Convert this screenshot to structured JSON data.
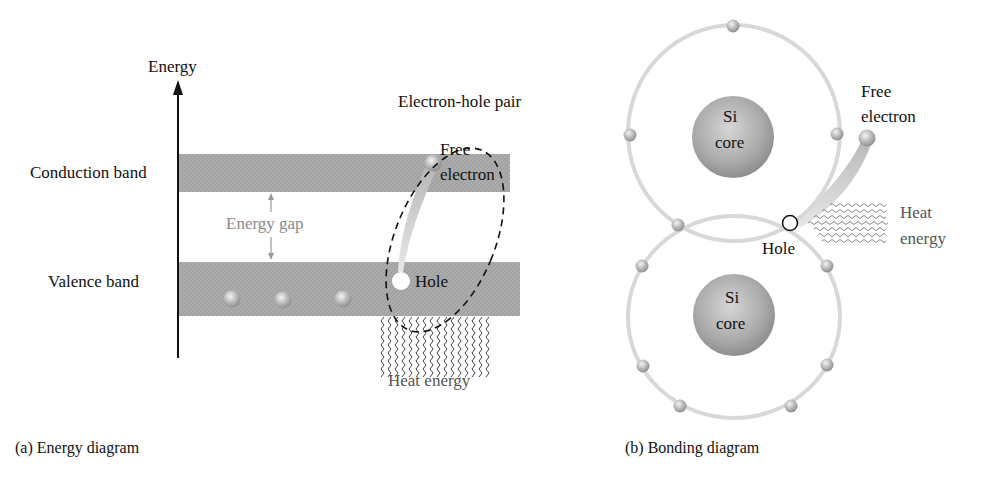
{
  "energy_diagram": {
    "axis_label": "Energy",
    "conduction_band_label": "Conduction band",
    "valence_band_label": "Valence band",
    "energy_gap_label": "Energy gap",
    "pair_label": "Electron-hole pair",
    "free_electron_label_1": "Free",
    "free_electron_label_2": "electron",
    "hole_label": "Hole",
    "heat_label": "Heat energy",
    "caption": "(a) Energy diagram",
    "valence_electron_count": 3
  },
  "bonding_diagram": {
    "core_top_label_1": "Si",
    "core_top_label_2": "core",
    "core_bottom_label_1": "Si",
    "core_bottom_label_2": "core",
    "free_electron_label_1": "Free",
    "free_electron_label_2": "electron",
    "hole_label": "Hole",
    "heat_label_1": "Heat",
    "heat_label_2": "energy",
    "caption": "(b) Bonding diagram"
  },
  "colors": {
    "band": "#aaaaaa",
    "orbit": "#d8d8d8",
    "core": "#a8a8a8",
    "label_gray": "#8a8a8a",
    "text": "#111111"
  }
}
